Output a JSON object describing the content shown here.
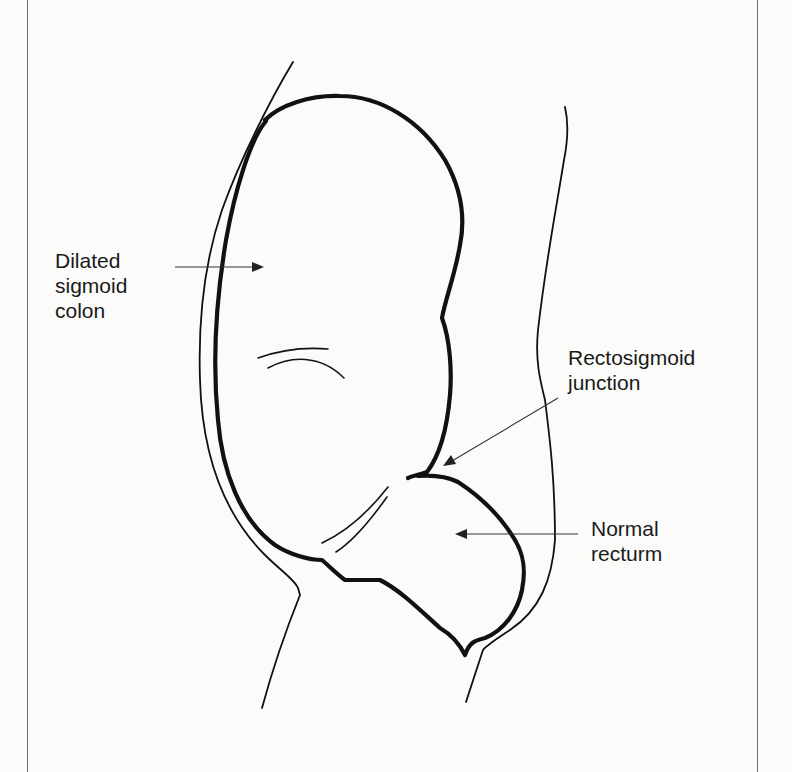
{
  "diagram": {
    "type": "anatomical line drawing",
    "labels": {
      "dilated_colon": {
        "lines": [
          "Dilated",
          "sigmoid",
          "colon"
        ],
        "arrow_target": "interior of dilated sigmoid loop"
      },
      "rectosigmoid_junction": {
        "lines": [
          "Rectosigmoid",
          "junction"
        ],
        "arrow_target": "narrow point where colon meets rectum"
      },
      "normal_rectum": {
        "lines": [
          "Normal",
          "recturm"
        ],
        "arrow_target": "interior of rectum"
      }
    }
  },
  "colors": {
    "background": "#fbfbfa",
    "ink": "#111111",
    "frame": "#6e6e6e"
  }
}
